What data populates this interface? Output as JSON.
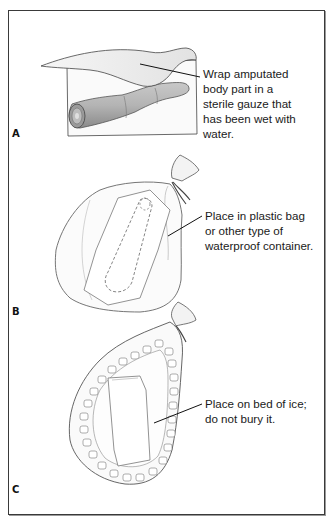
{
  "figure": {
    "panels": [
      {
        "label": "A",
        "caption": "Wrap amputated\nbody part in a\nsterile gauze that\nhas been wet with\nwater.",
        "illustration": "amputated-finger-wrapped-in-gauze"
      },
      {
        "label": "B",
        "caption": "Place in plastic bag\nor other type of\nwaterproof container.",
        "illustration": "wrapped-part-in-tied-plastic-bag"
      },
      {
        "label": "C",
        "caption": "Place on bed of ice;\ndo not bury it.",
        "illustration": "bag-resting-on-ice-cubes"
      }
    ]
  },
  "colors": {
    "frame": "#3a3a3a",
    "line_art": "#555555",
    "skin_shade": "#a8a8a8",
    "text": "#1a1a1a"
  }
}
